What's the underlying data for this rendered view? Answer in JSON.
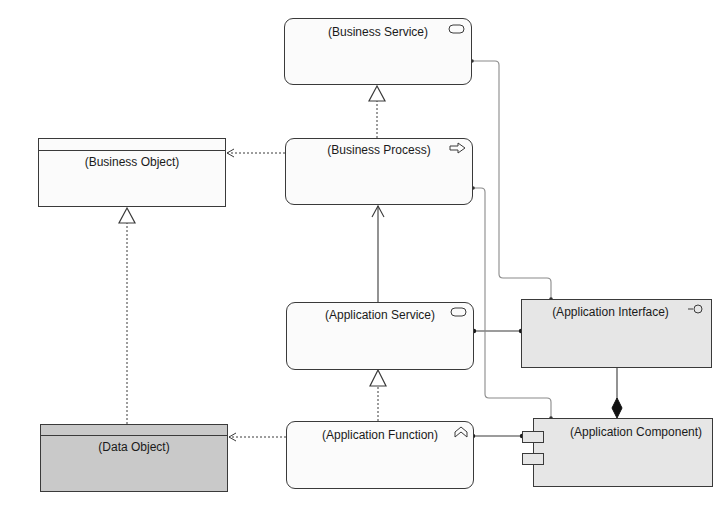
{
  "diagram": {
    "type": "ArchiMate layered view",
    "nodes": {
      "business_service": {
        "label": "(Business Service)",
        "icon": "service-icon"
      },
      "business_process": {
        "label": "(Business Process)",
        "icon": "process-arrow-icon"
      },
      "business_object": {
        "label": "(Business Object)"
      },
      "application_service": {
        "label": "(Application Service)",
        "icon": "service-icon"
      },
      "application_interface": {
        "label": "(Application Interface)",
        "icon": "interface-lollipop-icon"
      },
      "application_component": {
        "label": "(Application Component)",
        "icon": "component-icon"
      },
      "application_function": {
        "label": "(Application Function)",
        "icon": "function-chevron-icon"
      },
      "data_object": {
        "label": "(Data Object)"
      }
    },
    "relations": [
      {
        "from": "business_process",
        "to": "business_service",
        "type": "realization"
      },
      {
        "from": "business_process",
        "to": "business_object",
        "type": "access"
      },
      {
        "from": "application_service",
        "to": "business_process",
        "type": "serving"
      },
      {
        "from": "data_object",
        "to": "business_object",
        "type": "realization"
      },
      {
        "from": "application_function",
        "to": "application_service",
        "type": "realization"
      },
      {
        "from": "application_function",
        "to": "data_object",
        "type": "access"
      },
      {
        "from": "application_service",
        "to": "application_interface",
        "type": "assignment"
      },
      {
        "from": "application_function",
        "to": "application_component",
        "type": "assignment"
      },
      {
        "from": "application_component",
        "to": "application_interface",
        "type": "composition"
      },
      {
        "from": "business_service",
        "to": "application_interface",
        "type": "association"
      },
      {
        "from": "business_process",
        "to": "application_component",
        "type": "association"
      }
    ],
    "colors": {
      "line": "#3a3a3a",
      "connector_gray": "#8a8a8a",
      "application_fill": "#e6e6e6",
      "data_object_fill": "#c9c9c9",
      "business_fill": "#fbfbfb"
    }
  }
}
